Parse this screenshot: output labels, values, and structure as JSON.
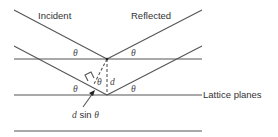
{
  "diagram": {
    "labels": {
      "incident": "Incident",
      "reflected": "Reflected",
      "lattice_planes": "Lattice planes",
      "theta": "θ",
      "d": "d",
      "path_difference_d": "d",
      "path_difference_rest": " sin ",
      "path_difference_theta": "θ"
    },
    "colors": {
      "line": "#555555",
      "text": "#333333"
    }
  }
}
